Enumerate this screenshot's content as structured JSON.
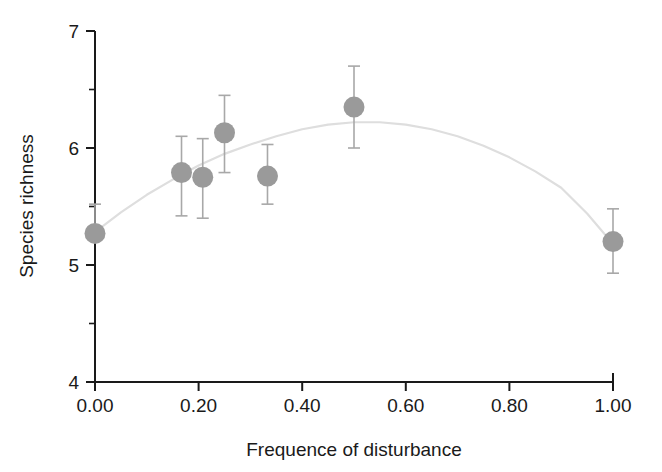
{
  "chart_data": {
    "type": "scatter",
    "title": "",
    "xlabel": "Frequence of disturbance",
    "ylabel": "Species richness",
    "xlim": [
      0.0,
      1.0
    ],
    "ylim": [
      4,
      7
    ],
    "grid": false,
    "legend": null,
    "x_ticks": [
      0.0,
      0.2,
      0.4,
      0.6,
      0.8,
      1.0
    ],
    "x_tick_labels": [
      "0.00",
      "0.20",
      "0.40",
      "0.60",
      "0.80",
      "1.00"
    ],
    "y_ticks": [
      4,
      5,
      6,
      7
    ],
    "y_tick_labels": [
      "4",
      "5",
      "6",
      "7"
    ],
    "y_minor_ticks": [
      4.5,
      5.5,
      6.5
    ],
    "marker_color": "#9a9a9a",
    "errorbar_color": "#a8a8a8",
    "line_color": "#dedede",
    "axis_color": "#1a1a1a",
    "points": [
      {
        "x": 0.0,
        "y": 5.27,
        "y_low": 5.27,
        "y_high": 5.52
      },
      {
        "x": 0.167,
        "y": 5.79,
        "y_low": 5.42,
        "y_high": 6.1
      },
      {
        "x": 0.208,
        "y": 5.75,
        "y_low": 5.4,
        "y_high": 6.08
      },
      {
        "x": 0.25,
        "y": 6.13,
        "y_low": 5.79,
        "y_high": 6.45
      },
      {
        "x": 0.333,
        "y": 5.76,
        "y_low": 5.52,
        "y_high": 6.03
      },
      {
        "x": 0.5,
        "y": 6.35,
        "y_low": 6.0,
        "y_high": 6.7
      },
      {
        "x": 1.0,
        "y": 5.2,
        "y_low": 4.93,
        "y_high": 5.48
      }
    ],
    "series": [
      {
        "name": "Species richness (mean ± SE)",
        "x": [
          0.0,
          0.167,
          0.208,
          0.25,
          0.333,
          0.5,
          1.0
        ],
        "values": [
          5.27,
          5.79,
          5.75,
          6.13,
          5.76,
          6.35,
          5.2
        ],
        "yerr_low": [
          0.0,
          0.37,
          0.35,
          0.34,
          0.24,
          0.35,
          0.27
        ],
        "yerr_high": [
          0.25,
          0.31,
          0.33,
          0.32,
          0.27,
          0.35,
          0.28
        ]
      },
      {
        "name": "Quadratic fit",
        "type": "line",
        "x": [
          0.0,
          0.05,
          0.1,
          0.15,
          0.2,
          0.25,
          0.3,
          0.35,
          0.4,
          0.45,
          0.5,
          0.55,
          0.6,
          0.65,
          0.7,
          0.75,
          0.8,
          0.85,
          0.9,
          0.95,
          1.0
        ],
        "values": [
          5.28,
          5.45,
          5.6,
          5.73,
          5.85,
          5.95,
          6.03,
          6.1,
          6.16,
          6.2,
          6.22,
          6.22,
          6.2,
          6.16,
          6.1,
          6.02,
          5.92,
          5.8,
          5.66,
          5.44,
          5.18
        ]
      }
    ]
  }
}
